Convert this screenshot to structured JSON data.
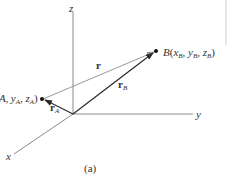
{
  "diagram": {
    "type": "3d-position-vector",
    "caption": "(a)",
    "axes": {
      "x": {
        "label": "x"
      },
      "y": {
        "label": "y"
      },
      "z": {
        "label": "z"
      }
    },
    "points": {
      "A": {
        "label_prefix": "(x",
        "label": "A, yA, zA)",
        "display": "(x_A, y_A, z_A)"
      },
      "B": {
        "label": "B(xB, yB, zB)",
        "display": "B(x_B, y_B, z_B)"
      }
    },
    "vectors": {
      "r": {
        "label": "r"
      },
      "rA": {
        "label": "r",
        "sub": "A"
      },
      "rB": {
        "label": "r",
        "sub": "B"
      }
    },
    "colors": {
      "axis": "#8a8a8a",
      "vector": "#2a2a2a",
      "r_vector": "#9a9a9a",
      "text": "#333333"
    }
  }
}
